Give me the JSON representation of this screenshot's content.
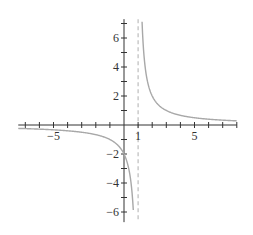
{
  "chart_data": {
    "type": "line",
    "title": "",
    "xlabel": "",
    "ylabel": "",
    "function": "y = 2/(x - 1)",
    "xlim": [
      -7.5,
      8
    ],
    "ylim": [
      -6.7,
      7.3
    ],
    "grid": false,
    "legend": null,
    "x_tick_labels": [
      {
        "value": -5,
        "label": "−5"
      },
      {
        "value": 1,
        "label": "1"
      },
      {
        "value": 5,
        "label": "5"
      }
    ],
    "y_tick_labels": [
      {
        "value": 6,
        "label": "6"
      },
      {
        "value": 4,
        "label": "4"
      },
      {
        "value": 2,
        "label": "2"
      },
      {
        "value": -2,
        "label": "−2"
      },
      {
        "value": -4,
        "label": "−4"
      },
      {
        "value": -6,
        "label": "−6"
      }
    ],
    "asymptotes": [
      {
        "type": "vertical",
        "x": 1,
        "style": "dashed"
      },
      {
        "type": "horizontal",
        "y": 0
      }
    ],
    "series": [
      {
        "name": "left branch",
        "x": [
          -7.5,
          -6,
          -5,
          -4,
          -3,
          -2,
          -1,
          0,
          0.5,
          0.7
        ],
        "y": [
          -0.24,
          -0.29,
          -0.33,
          -0.4,
          -0.5,
          -0.67,
          -1,
          -2,
          -4,
          -6.67
        ]
      },
      {
        "name": "right branch",
        "x": [
          1.27,
          1.5,
          2,
          3,
          4,
          5,
          6,
          7,
          8
        ],
        "y": [
          7.3,
          4,
          2,
          1,
          0.67,
          0.5,
          0.4,
          0.33,
          0.29
        ]
      }
    ],
    "colors": {
      "axis": "#333333",
      "curve": "#a8a8a8",
      "asymptote": "#bdbdbd"
    }
  }
}
